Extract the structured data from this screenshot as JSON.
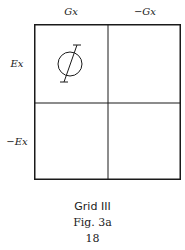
{
  "diagram": {
    "columns": [
      {
        "label": "Gx"
      },
      {
        "label": "−Gx"
      }
    ],
    "rows": [
      {
        "label": "Ex"
      },
      {
        "label": "−Ex"
      }
    ],
    "cells": [
      {
        "row": 0,
        "col": 0,
        "symbol": "circle-with-slanted-stroke"
      },
      {
        "row": 0,
        "col": 1,
        "symbol": ""
      },
      {
        "row": 1,
        "col": 0,
        "symbol": ""
      },
      {
        "row": 1,
        "col": 1,
        "symbol": ""
      }
    ]
  },
  "caption": {
    "title": "Grid III",
    "figure": "Fig. 3a",
    "page": "18"
  },
  "colors": {
    "ink": "#1a1a1a",
    "background": "#ffffff"
  }
}
